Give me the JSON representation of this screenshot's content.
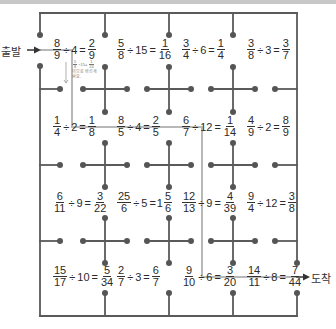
{
  "labels": {
    "start": "출발",
    "end": "도착"
  },
  "colors": {
    "wall": "#5a5a5a",
    "path": "#b8b8b8",
    "dot": "#555555"
  },
  "correction_note": {
    "equation": {
      "n1": "5",
      "d1": "8",
      "op": "÷15=",
      "n2": "1",
      "d2": "24"
    },
    "line1": "이므로 바르게",
    "line2": "써요."
  },
  "equations": [
    {
      "row": 1,
      "col": 1,
      "a_num": "8",
      "a_den": "9",
      "divisor": "4",
      "r_num": "2",
      "r_den": "9"
    },
    {
      "row": 1,
      "col": 2,
      "a_num": "5",
      "a_den": "8",
      "divisor": "15",
      "r_num": "1",
      "r_den": "16"
    },
    {
      "row": 1,
      "col": 3,
      "a_num": "3",
      "a_den": "4",
      "divisor": "6",
      "r_num": "1",
      "r_den": "4"
    },
    {
      "row": 1,
      "col": 4,
      "a_num": "3",
      "a_den": "8",
      "divisor": "3",
      "r_num": "3",
      "r_den": "7"
    },
    {
      "row": 2,
      "col": 1,
      "a_num": "1",
      "a_den": "4",
      "divisor": "2",
      "r_num": "1",
      "r_den": "8"
    },
    {
      "row": 2,
      "col": 2,
      "a_num": "8",
      "a_den": "5",
      "divisor": "4",
      "r_num": "2",
      "r_den": "5"
    },
    {
      "row": 2,
      "col": 3,
      "a_num": "6",
      "a_den": "7",
      "divisor": "12",
      "r_num": "1",
      "r_den": "14"
    },
    {
      "row": 2,
      "col": 4,
      "a_num": "4",
      "a_den": "9",
      "divisor": "2",
      "r_num": "8",
      "r_den": "9"
    },
    {
      "row": 3,
      "col": 1,
      "a_num": "6",
      "a_den": "11",
      "divisor": "9",
      "r_num": "3",
      "r_den": "22"
    },
    {
      "row": 3,
      "col": 2,
      "a_num": "25",
      "a_den": "6",
      "divisor": "5",
      "r_whole": "1",
      "r_num": "5",
      "r_den": "6"
    },
    {
      "row": 3,
      "col": 3,
      "a_num": "12",
      "a_den": "13",
      "divisor": "9",
      "r_num": "4",
      "r_den": "39"
    },
    {
      "row": 3,
      "col": 4,
      "a_num": "9",
      "a_den": "4",
      "divisor": "12",
      "r_num": "3",
      "r_den": "8"
    },
    {
      "row": 4,
      "col": 1,
      "a_num": "15",
      "a_den": "17",
      "divisor": "10",
      "r_num": "5",
      "r_den": "34"
    },
    {
      "row": 4,
      "col": 2,
      "a_num": "2",
      "a_den": "7",
      "divisor": "3",
      "r_num": "6",
      "r_den": "7"
    },
    {
      "row": 4,
      "col": 3,
      "a_num": "9",
      "a_den": "10",
      "divisor": "6",
      "r_num": "3",
      "r_den": "20"
    },
    {
      "row": 4,
      "col": 4,
      "a_num": "14",
      "a_den": "11",
      "divisor": "8",
      "r_num": "7",
      "r_den": "44"
    }
  ],
  "symbols": {
    "divide": "÷",
    "equals": "=",
    "arrow": "→"
  }
}
